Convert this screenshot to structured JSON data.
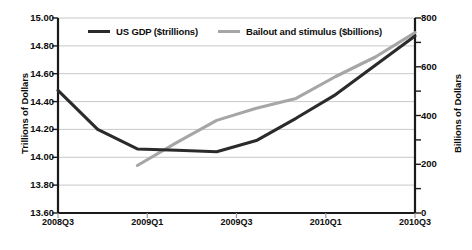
{
  "chart_data": {
    "type": "line",
    "title": "",
    "xlabel": "",
    "ylabel": "Trillions of Dollars",
    "ylabel_secondary": "Billions of Dollars",
    "categories": [
      "2008Q3",
      "2008Q4",
      "2009Q1",
      "2009Q2",
      "2009Q3",
      "2009Q4",
      "2010Q1",
      "2010Q2",
      "2010Q3",
      "2010Q4"
    ],
    "x_tick_labels": [
      "2008Q3",
      "2009Q1",
      "2009Q3",
      "2010Q1",
      "2010Q3"
    ],
    "y_tick_labels": [
      "15.00",
      "14.80",
      "14.60",
      "14.40",
      "14.20",
      "14.00",
      "13.80",
      "13.60"
    ],
    "y_tick_labels_secondary": [
      "800",
      "600",
      "400",
      "200",
      "0"
    ],
    "ylim": [
      13.6,
      15.0
    ],
    "ylim_secondary": [
      0,
      800
    ],
    "grid": true,
    "legend_position": "top-center",
    "series": [
      {
        "name": "US GDP ($trillions)",
        "axis": "left",
        "color": "#2b2b2b",
        "values": [
          14.48,
          14.2,
          14.06,
          14.05,
          14.04,
          14.12,
          14.28,
          14.45,
          14.66,
          14.87
        ]
      },
      {
        "name": "Bailout and stimulus ($billions)",
        "axis": "right",
        "color": "#a6a6a6",
        "values": [
          null,
          null,
          195,
          290,
          380,
          430,
          470,
          560,
          640,
          740
        ]
      }
    ]
  },
  "legend": {
    "items": [
      {
        "label": "US GDP ($trillions)",
        "color": "#2b2b2b",
        "swatch_name": "legend-swatch-us-gdp"
      },
      {
        "label": "Bailout and stimulus ($billions)",
        "color": "#a6a6a6",
        "swatch_name": "legend-swatch-bailout"
      }
    ]
  },
  "axes": {
    "left_title": "Trillions of Dollars",
    "right_title": "Billions of Dollars"
  },
  "caption": "",
  "colors": {
    "gdp_line": "#2b2b2b",
    "bailout_line": "#a6a6a6",
    "gridline": "#c9c9c9",
    "axis": "#1a1a1a",
    "background": "#ffffff"
  }
}
